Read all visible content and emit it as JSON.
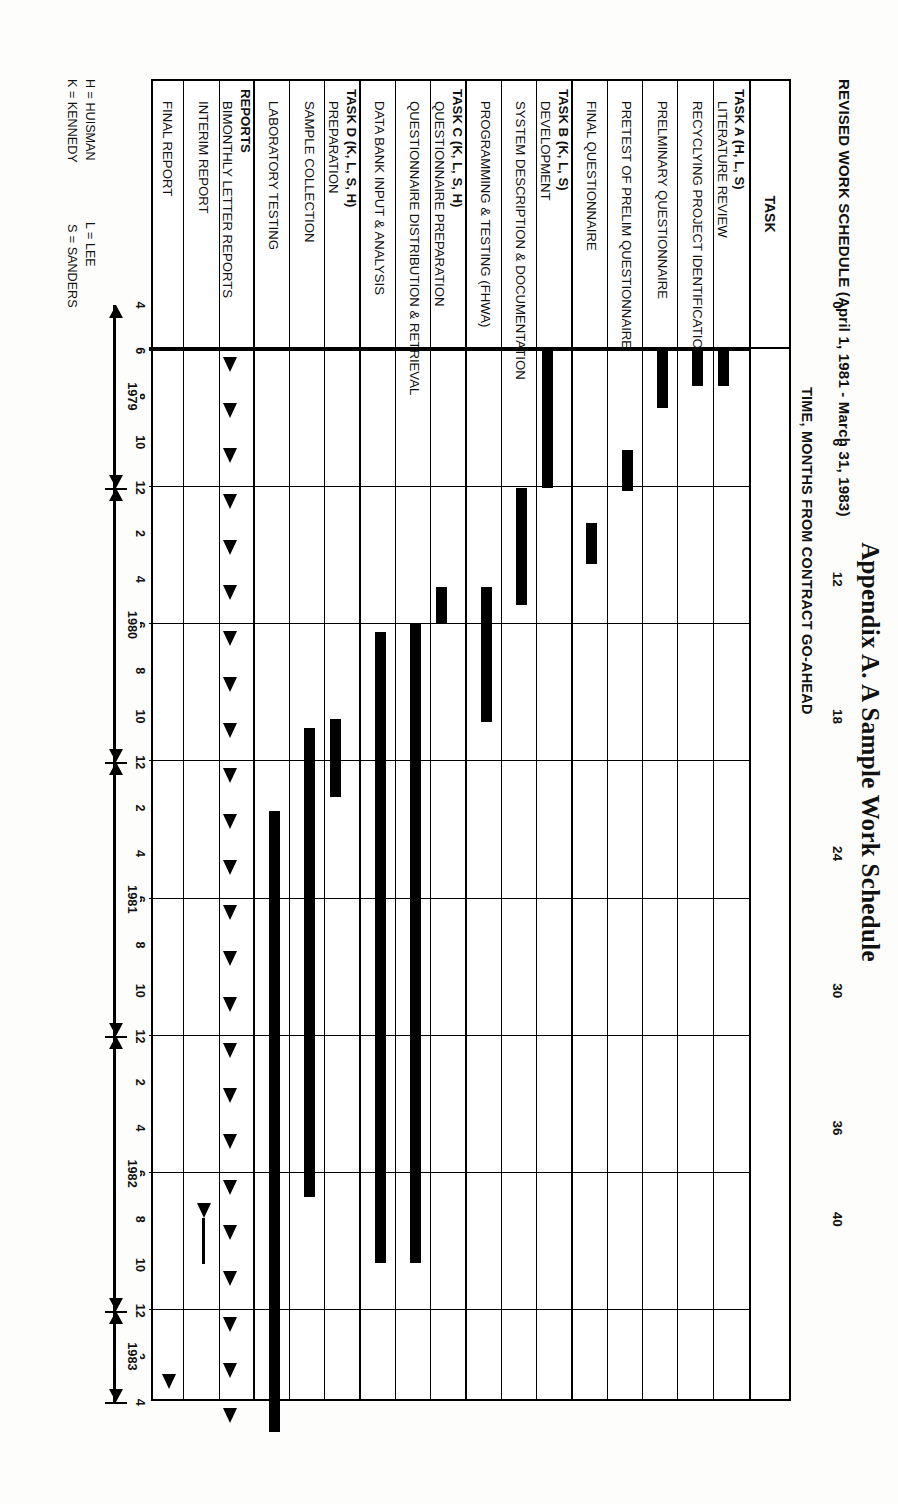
{
  "figure": {
    "title": "REVISED WORK SCHEDULE (April 1, 1981 - March 31, 1983)",
    "axis_title": "TIME, MONTHS FROM CONTRACT GO-AHEAD",
    "task_column_header": "TASK",
    "caption": "Appendix A. A Sample Work Schedule"
  },
  "legend": {
    "line1_left": "H = HUISMAN",
    "line1_right": "L = LEE",
    "line2_left": "K = KENNEDY",
    "line2_right": "S = SANDERS"
  },
  "chart_data": {
    "type": "bar",
    "title": "REVISED WORK SCHEDULE (April 1, 1981 - March 31, 1983)",
    "xlabel": "TIME, MONTHS FROM CONTRACT GO-AHEAD",
    "ylabel": "TASK",
    "xlim": [
      0,
      46
    ],
    "grid": true,
    "top_ticks": [
      0,
      6,
      12,
      18,
      24,
      30,
      36,
      40
    ],
    "month_ticks": [
      {
        "v": 0,
        "label": "4"
      },
      {
        "v": 2,
        "label": "6"
      },
      {
        "v": 4,
        "label": "8"
      },
      {
        "v": 6,
        "label": "10"
      },
      {
        "v": 8,
        "label": "12"
      },
      {
        "v": 10,
        "label": "2"
      },
      {
        "v": 12,
        "label": "4"
      },
      {
        "v": 14,
        "label": "6"
      },
      {
        "v": 16,
        "label": "8"
      },
      {
        "v": 18,
        "label": "10"
      },
      {
        "v": 20,
        "label": "12"
      },
      {
        "v": 22,
        "label": "2"
      },
      {
        "v": 24,
        "label": "4"
      },
      {
        "v": 26,
        "label": "6"
      },
      {
        "v": 28,
        "label": "8"
      },
      {
        "v": 30,
        "label": "10"
      },
      {
        "v": 32,
        "label": "12"
      },
      {
        "v": 34,
        "label": "2"
      },
      {
        "v": 36,
        "label": "4"
      },
      {
        "v": 38,
        "label": "6"
      },
      {
        "v": 40,
        "label": "8"
      },
      {
        "v": 42,
        "label": "10"
      },
      {
        "v": 44,
        "label": "12"
      },
      {
        "v": 46,
        "label": "2"
      },
      {
        "v": 48,
        "label": "4"
      }
    ],
    "year_spans": [
      {
        "label": "1979",
        "start": 0,
        "end": 8
      },
      {
        "label": "1980",
        "start": 8,
        "end": 20
      },
      {
        "label": "1981",
        "start": 20,
        "end": 32
      },
      {
        "label": "1982",
        "start": 32,
        "end": 44
      },
      {
        "label": "1983",
        "start": 44,
        "end": 48
      }
    ],
    "groups": [
      {
        "name": "TASK A (H, L, S)",
        "tasks": [
          {
            "label": "LITERATURE REVIEW",
            "start": 0,
            "end": 1.6,
            "kind": "bar"
          },
          {
            "label": "RECYCLYING PROJECT IDENTIFICATION",
            "start": 0,
            "end": 1.6,
            "kind": "bar"
          },
          {
            "label": "PRELMINARY QUESTIONNAIRE",
            "start": 0,
            "end": 2.6,
            "kind": "bar"
          },
          {
            "label": "PRETEST OF PRELIM QUESTIONNAIRE",
            "start": 4.4,
            "end": 6.2,
            "kind": "bar"
          },
          {
            "label": "FINAL QUESTIONNAIRE",
            "start": 7.6,
            "end": 9.4,
            "kind": "bar"
          }
        ]
      },
      {
        "name": "TASK B (K, L, S)",
        "tasks": [
          {
            "label": "DEVELOPMENT",
            "start": 0,
            "end": 6.1,
            "kind": "bar"
          },
          {
            "label": "SYSTEM DESCRIPTION & DOCUMENTATION",
            "start": 6.1,
            "end": 11.2,
            "kind": "bar"
          },
          {
            "label": "PROGRAMMING & TESTING (FHWA)",
            "start": 10.4,
            "end": 16.3,
            "kind": "bar"
          }
        ]
      },
      {
        "name": "TASK C (K, L, S, H)",
        "tasks": [
          {
            "label": "QUESTIONNAIRE PREPARATION",
            "start": 10.4,
            "end": 12.0,
            "kind": "bar"
          },
          {
            "label": "QUESTIONNAIRE DISTRIBUTION & RETRIEVAL",
            "start": 12.0,
            "end": 40.0,
            "kind": "bar"
          },
          {
            "label": "DATA BANK INPUT & ANALYSIS",
            "start": 12.4,
            "end": 40.0,
            "kind": "bar"
          }
        ]
      },
      {
        "name": "TASK D (K, L, S, H)",
        "tasks": [
          {
            "label": "PREPARATION",
            "start": 16.2,
            "end": 19.6,
            "kind": "bar"
          },
          {
            "label": "SAMPLE COLLECTION",
            "start": 16.6,
            "end": 37.1,
            "kind": "bar"
          },
          {
            "label": "LABORATORY TESTING",
            "start": 20.2,
            "end": 47.4,
            "kind": "bar"
          }
        ]
      },
      {
        "name": "REPORTS",
        "tasks": [
          {
            "label": "BIMONTHLY LETTER REPORTS",
            "kind": "milestones",
            "milestones": [
              1.0,
              3.0,
              5.0,
              7.0,
              9.0,
              11.0,
              13.0,
              15.0,
              17.0,
              19.0,
              21.0,
              23.0,
              25.0,
              27.0,
              29.0,
              31.0,
              33.0,
              35.0,
              37.0,
              39.0,
              41.0,
              43.0,
              45.0,
              47.0
            ]
          },
          {
            "label": "INTERIM REPORT",
            "kind": "milestone-long",
            "at": 38.0
          },
          {
            "label": "FINAL REPORT",
            "kind": "milestone",
            "at": 45.5
          }
        ]
      }
    ]
  }
}
